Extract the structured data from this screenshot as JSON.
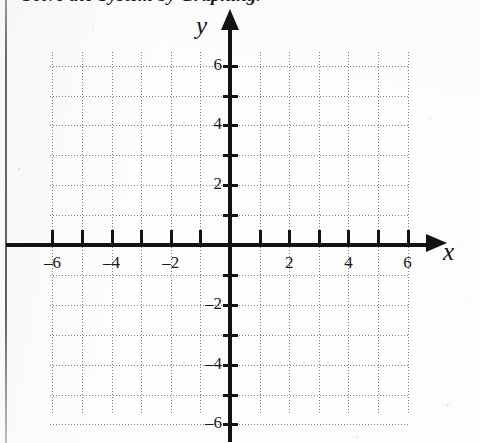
{
  "document": {
    "type": "math-worksheet-scan",
    "heading_clipped": "Solve the System by Graphing."
  },
  "axes": {
    "x_label": "x",
    "y_label": "y",
    "arrow_up_icon": "arrow-up-icon",
    "arrow_right_icon": "arrow-right-icon"
  },
  "chart_data": {
    "type": "scatter",
    "title": "",
    "xlabel": "x",
    "ylabel": "y",
    "xlim": [
      -6.5,
      6.5
    ],
    "ylim": [
      -6.5,
      6.5
    ],
    "grid": true,
    "grid_style": "dotted",
    "grid_step": 1,
    "legend": "none",
    "series": [],
    "x_tick_values": [
      -6,
      -4,
      -2,
      2,
      4,
      6
    ],
    "y_tick_values": [
      6,
      4,
      2,
      -2,
      -4,
      -6
    ],
    "x_tick_labels": [
      "–6",
      "–4",
      "–2",
      "2",
      "4",
      "6"
    ],
    "y_tick_labels": [
      "6",
      "4",
      "2",
      "–2",
      "–4",
      "–6"
    ],
    "minor_tick_values": [
      -6,
      -5,
      -4,
      -3,
      -2,
      -1,
      1,
      2,
      3,
      4,
      5,
      6
    ],
    "annotations": []
  }
}
